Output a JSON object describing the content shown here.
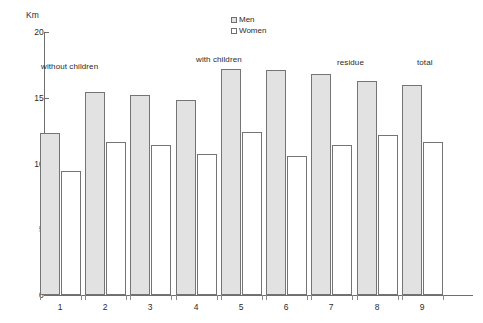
{
  "chart_data": {
    "type": "bar",
    "title": "",
    "xlabel": "",
    "ylabel": "Km",
    "ylim": [
      0,
      20
    ],
    "yticks": [
      0,
      5,
      10,
      15,
      20
    ],
    "ytick_labels": [
      "0",
      "5",
      "10",
      "15",
      "20"
    ],
    "grid": false,
    "legend_position": "top-center",
    "categories": [
      "1",
      "2",
      "3",
      "4",
      "5",
      "6",
      "7",
      "8",
      "9"
    ],
    "series": [
      {
        "name": "Men",
        "color": "#e2e2e2",
        "values": [
          12.3,
          15.4,
          15.2,
          14.8,
          17.2,
          17.1,
          16.8,
          16.3,
          16.0
        ]
      },
      {
        "name": "Women",
        "color": "#ffffff",
        "values": [
          9.4,
          11.6,
          11.4,
          10.7,
          12.4,
          10.6,
          11.4,
          12.2,
          11.6
        ]
      }
    ],
    "annotations": [
      {
        "text": "without children",
        "category_start": "1",
        "category_end": "3"
      },
      {
        "text": "with children",
        "category_start": "4",
        "category_end": "7"
      },
      {
        "text": "residue",
        "category_start": "8",
        "category_end": "8"
      },
      {
        "text": "total",
        "category_start": "9",
        "category_end": "9"
      }
    ]
  },
  "axis": {
    "y_title": "Km",
    "y_labels": [
      "20",
      "15",
      "10",
      "5",
      "0"
    ],
    "x_labels": [
      "1",
      "2",
      "3",
      "4",
      "5",
      "6",
      "7",
      "8",
      "9"
    ]
  },
  "legend": {
    "items": [
      {
        "label": "Men"
      },
      {
        "label": "Women"
      }
    ]
  },
  "annotations": {
    "items": [
      {
        "label": "without children"
      },
      {
        "label": "with children"
      },
      {
        "label": "residue"
      },
      {
        "label": "total"
      }
    ]
  }
}
